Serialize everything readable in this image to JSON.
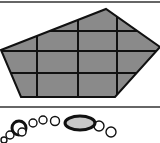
{
  "canvas": {
    "width": 160,
    "height": 143,
    "background": "#ffffff"
  },
  "colors": {
    "stroke": "#111111",
    "polygon_fill": "#8a8a8a",
    "ellipse_fill": "#c8c8c8",
    "bead_fill": "#ffffff",
    "divider": "#333333"
  },
  "dividers": [
    {
      "y": 2
    },
    {
      "y": 107
    }
  ],
  "polygon": {
    "vertices": [
      [
        1,
        50
      ],
      [
        106,
        9
      ],
      [
        160,
        47
      ],
      [
        115,
        97
      ],
      [
        21,
        97
      ]
    ],
    "grid_horizontal_y": [
      31,
      51,
      73
    ],
    "grid_vertical_x": [
      37,
      78,
      117
    ]
  },
  "necklace": {
    "beads": [
      {
        "cx": 4,
        "cy": 140,
        "r": 3,
        "thick": false
      },
      {
        "cx": 10,
        "cy": 135,
        "r": 4,
        "thick": false
      },
      {
        "cx": 19,
        "cy": 128,
        "r": 7,
        "thick": true
      },
      {
        "cx": 22,
        "cy": 132,
        "r": 4,
        "thick": false
      },
      {
        "cx": 33,
        "cy": 123,
        "r": 4,
        "thick": false
      },
      {
        "cx": 43,
        "cy": 120,
        "r": 4,
        "thick": false
      },
      {
        "cx": 55,
        "cy": 121,
        "r": 4.5,
        "thick": false
      },
      {
        "cx": 99,
        "cy": 126,
        "r": 5,
        "thick": false
      },
      {
        "cx": 111,
        "cy": 132,
        "r": 5,
        "thick": false
      }
    ],
    "ellipse": {
      "cx": 80,
      "cy": 123,
      "rx": 15,
      "ry": 7
    }
  }
}
